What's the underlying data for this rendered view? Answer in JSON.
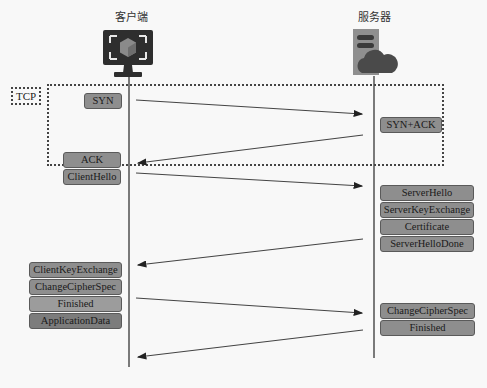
{
  "actors": {
    "client": {
      "label": "客户端",
      "icon": "monitor-cube-icon"
    },
    "server": {
      "label": "服务器",
      "icon": "server-cloud-icon"
    }
  },
  "tcp_frame": {
    "label": "TCP"
  },
  "messages": {
    "syn": "SYN",
    "syn_ack": "SYN+ACK",
    "ack": "ACK",
    "client_hello": "ClientHello",
    "server_hello": "ServerHello",
    "server_key_exchange": "ServerKeyExchange",
    "certificate": "Certificate",
    "server_hello_done": "ServerHelloDone",
    "client_key_exchange": "ClientKeyExchange",
    "change_cipher_spec_client": "ChangeCipherSpec",
    "finished_client": "Finished",
    "application_data": "ApplicationData",
    "change_cipher_spec_server": "ChangeCipherSpec",
    "finished_server": "Finished"
  },
  "arrows": [
    {
      "from": "client",
      "to": "server",
      "label_ref": "syn"
    },
    {
      "from": "server",
      "to": "client",
      "label_ref": "syn_ack"
    },
    {
      "from": "client",
      "to": "server",
      "label_ref": "client_hello"
    },
    {
      "from": "server",
      "to": "client",
      "label_ref": "server_hello_done"
    },
    {
      "from": "client",
      "to": "server",
      "label_ref": "finished_client"
    },
    {
      "from": "server",
      "to": "client",
      "label_ref": "finished_server"
    }
  ]
}
